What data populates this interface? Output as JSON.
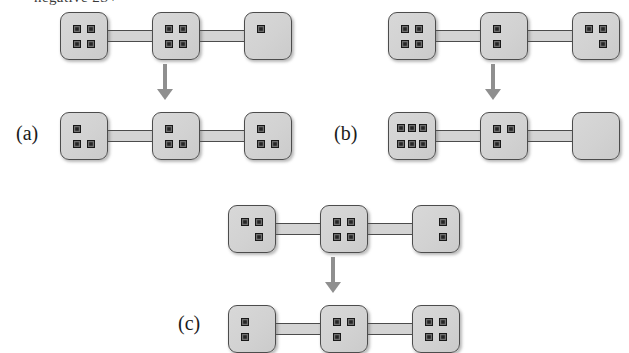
{
  "figure": {
    "top_text_fragment": "negative 2S+",
    "background_color": "#ffffff",
    "box_fill_color": "#d4d4d4",
    "box_border_color": "#4c4c4c",
    "dot_color": "#262626",
    "arrow_color": "#8f8f8f"
  },
  "panels": [
    {
      "label": "(a)",
      "label_x": 16,
      "label_y": 122,
      "origin_x": 60,
      "origin_y": 12,
      "arrow": {
        "x": 154,
        "y": 64,
        "height": 36
      },
      "rows": [
        {
          "name": "before",
          "y": 0,
          "boxes": [
            {
              "dot_count": 4,
              "layout": "2x2",
              "cells": [
                1,
                1,
                0,
                1,
                1,
                0
              ]
            },
            {
              "dot_count": 4,
              "layout": "2x2",
              "cells": [
                1,
                1,
                0,
                1,
                1,
                0
              ]
            },
            {
              "dot_count": 1,
              "layout": "2x2",
              "cells": [
                1,
                0,
                0,
                0,
                0,
                0
              ]
            }
          ]
        },
        {
          "name": "after",
          "y": 100,
          "boxes": [
            {
              "dot_count": 3,
              "layout": "2x2",
              "cells": [
                1,
                0,
                0,
                1,
                1,
                0
              ]
            },
            {
              "dot_count": 3,
              "layout": "2x2",
              "cells": [
                1,
                0,
                0,
                1,
                1,
                0
              ]
            },
            {
              "dot_count": 3,
              "layout": "2x2",
              "cells": [
                1,
                0,
                0,
                1,
                1,
                0
              ]
            }
          ]
        }
      ]
    },
    {
      "label": "(b)",
      "label_x": 334,
      "label_y": 122,
      "origin_x": 388,
      "origin_y": 12,
      "arrow": {
        "x": 482,
        "y": 64,
        "height": 36
      },
      "rows": [
        {
          "name": "before",
          "y": 0,
          "boxes": [
            {
              "dot_count": 4,
              "layout": "2x2",
              "cells": [
                1,
                1,
                0,
                1,
                1,
                0
              ]
            },
            {
              "dot_count": 2,
              "layout": "2x2",
              "cells": [
                1,
                0,
                0,
                1,
                0,
                0
              ]
            },
            {
              "dot_count": 3,
              "layout": "2x2",
              "cells": [
                1,
                1,
                0,
                0,
                1,
                0
              ]
            }
          ]
        },
        {
          "name": "after",
          "y": 100,
          "boxes": [
            {
              "dot_count": 6,
              "layout": "3x2",
              "cells": [
                1,
                1,
                1,
                1,
                1,
                1
              ]
            },
            {
              "dot_count": 3,
              "layout": "2x2",
              "cells": [
                1,
                1,
                0,
                1,
                0,
                0
              ]
            },
            {
              "dot_count": 0,
              "layout": "2x2",
              "cells": [
                0,
                0,
                0,
                0,
                0,
                0
              ]
            }
          ]
        }
      ]
    },
    {
      "label": "(c)",
      "label_x": 178,
      "label_y": 312,
      "origin_x": 228,
      "origin_y": 205,
      "arrow": {
        "x": 322,
        "y": 257,
        "height": 36
      },
      "rows": [
        {
          "name": "before",
          "y": 0,
          "boxes": [
            {
              "dot_count": 3,
              "layout": "2x2",
              "cells": [
                1,
                1,
                0,
                0,
                1,
                0
              ]
            },
            {
              "dot_count": 4,
              "layout": "2x2",
              "cells": [
                1,
                1,
                0,
                1,
                1,
                0
              ]
            },
            {
              "dot_count": 2,
              "layout": "2x2",
              "cells": [
                0,
                1,
                0,
                0,
                1,
                0
              ]
            }
          ]
        },
        {
          "name": "after",
          "y": 100,
          "boxes": [
            {
              "dot_count": 2,
              "layout": "2x2",
              "cells": [
                1,
                0,
                0,
                1,
                0,
                0
              ]
            },
            {
              "dot_count": 3,
              "layout": "2x2",
              "cells": [
                1,
                1,
                0,
                1,
                0,
                0
              ]
            },
            {
              "dot_count": 4,
              "layout": "2x2",
              "cells": [
                1,
                1,
                0,
                1,
                1,
                0
              ]
            }
          ]
        }
      ]
    }
  ],
  "geometry": {
    "box_size": 48,
    "box_gap": 44,
    "row_gap": 100
  }
}
